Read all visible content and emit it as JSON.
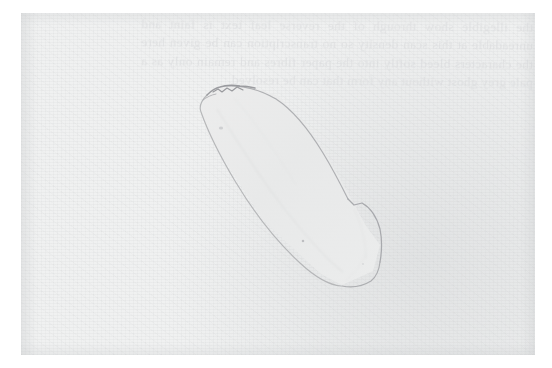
{
  "page": {
    "kind": "scanned-book-page",
    "background_color": "#ffffff",
    "paper_color": "#f0f1f1",
    "ink_color": "#9a9a9e",
    "ghost_text_color": "#d9dadc",
    "paper_bounds": {
      "left": 21,
      "top": 13,
      "width": 514,
      "height": 342
    }
  },
  "ghost_text": {
    "description": "illegible show-through text from the reverse side of the leaf, mirrored and extremely faint",
    "legible": false,
    "lines": [
      "the illegible show through of the",
      "reverse leaf text is faint and",
      "unreadable at this scan density so",
      "no transcription can be given here",
      "the characters bleed softly into the",
      "paper fibres and remain only as a",
      "pale grey ghost without any form",
      "that can be resolved"
    ]
  },
  "figure": {
    "name": "stone-tool-line-drawing",
    "orientation": "diagonal, upper-left to lower-right",
    "outline_color": "#a2a3a7",
    "fill_color": "#ebecec",
    "features": [
      {
        "name": "chipped-butt-end",
        "location": "top",
        "note": "darker rough chipped edge"
      },
      {
        "name": "angular-kink",
        "location": "right-mid",
        "note": "distinct notch on right margin"
      },
      {
        "name": "blunt-rounded-tip",
        "location": "bottom",
        "note": "wider squared terminus"
      },
      {
        "name": "interior-pit-mark",
        "location": "upper-left interior",
        "note": "tiny speck"
      },
      {
        "name": "interior-pit-mark-lower",
        "location": "lower-left interior",
        "note": "tiny speck"
      }
    ]
  }
}
